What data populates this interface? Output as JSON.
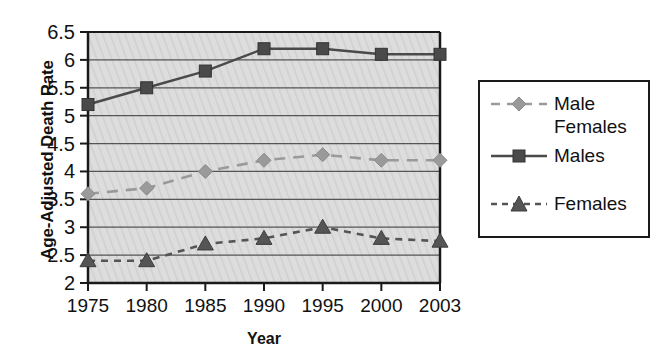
{
  "chart_data": {
    "type": "line",
    "title": "",
    "xlabel": "Year",
    "ylabel": "Age-Adjusted Death Rate",
    "categories": [
      "1975",
      "1980",
      "1985",
      "1990",
      "1995",
      "2000",
      "2003"
    ],
    "x": [
      1975,
      1980,
      1985,
      1990,
      1995,
      2000,
      2003
    ],
    "xlim": [
      1975,
      2003
    ],
    "ylim": [
      2,
      6.5
    ],
    "yticks": [
      "2",
      "2.5",
      "3",
      "3.5",
      "4",
      "4.5",
      "5",
      "5.5",
      "6",
      "6.5"
    ],
    "ytick_values": [
      2,
      2.5,
      3,
      3.5,
      4,
      4.5,
      5,
      5.5,
      6,
      6.5
    ],
    "grid": "horizontal",
    "legend_position": "right",
    "plot_background": "#dcdcdc",
    "series": [
      {
        "name": "Male Females",
        "legend_label": "Male\nFemales",
        "values": [
          3.6,
          3.7,
          4.0,
          4.2,
          4.3,
          4.2,
          4.2
        ],
        "color": "#9a9a9a",
        "marker": "diamond",
        "linestyle": "dashed"
      },
      {
        "name": "Males",
        "legend_label": "Males",
        "values": [
          5.2,
          5.5,
          5.8,
          6.2,
          6.2,
          6.1,
          6.1
        ],
        "color": "#4a4a4a",
        "marker": "square",
        "linestyle": "solid"
      },
      {
        "name": "Females",
        "legend_label": "Females",
        "values": [
          2.4,
          2.4,
          2.7,
          2.8,
          3.0,
          2.8,
          2.75
        ],
        "color": "#555555",
        "marker": "triangle",
        "linestyle": "dashed"
      }
    ]
  },
  "legend": {
    "items": [
      {
        "label": "Male\nFemales"
      },
      {
        "label": "Males"
      },
      {
        "label": "Females"
      }
    ]
  }
}
